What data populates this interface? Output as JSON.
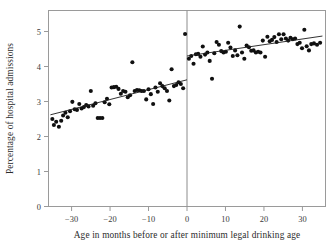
{
  "figure": {
    "name": "minimum-legal-drinking-age-rd-plot",
    "background_color": "#ffffff",
    "frame_color": "#9a9a9a",
    "point_color": "#101010",
    "fit_line_color": "#1c1c1c",
    "cutoff_line_color": "#8c8c8c"
  },
  "chart_data": {
    "type": "scatter",
    "title": "",
    "subtitle": "",
    "xlabel": "Age in months before or after minimum legal drinking age",
    "ylabel": "Percentage of hospital admissions",
    "xlim": [
      -36,
      36
    ],
    "ylim": [
      0,
      5.6
    ],
    "xticks": [
      -30,
      -20,
      -10,
      0,
      10,
      20,
      30
    ],
    "xticklabels": [
      "−30",
      "−20",
      "−10",
      "0",
      "10",
      "20",
      "30"
    ],
    "yticks": [
      0,
      1,
      2,
      3,
      4,
      5
    ],
    "yticklabels": [
      "0",
      "1",
      "2",
      "3",
      "4",
      "5"
    ],
    "grid": false,
    "legend": false,
    "cutoff": 0,
    "annotations": [
      {
        "name": "discontinuity-line",
        "x": 0,
        "description": "vertical line at minimum legal drinking age"
      }
    ],
    "series": [
      {
        "name": "below-mlda",
        "label": "Under legal drinking age",
        "marker": "filled-circle",
        "points": [
          [
            -35.0,
            2.5
          ],
          [
            -34.6,
            2.33
          ],
          [
            -34.0,
            2.42
          ],
          [
            -33.3,
            2.28
          ],
          [
            -32.7,
            2.45
          ],
          [
            -32.2,
            2.6
          ],
          [
            -31.6,
            2.68
          ],
          [
            -31.0,
            2.55
          ],
          [
            -30.4,
            2.72
          ],
          [
            -29.8,
            2.99
          ],
          [
            -29.2,
            2.78
          ],
          [
            -28.6,
            2.76
          ],
          [
            -28.0,
            2.93
          ],
          [
            -27.4,
            2.8
          ],
          [
            -26.8,
            2.84
          ],
          [
            -26.2,
            2.9
          ],
          [
            -25.6,
            2.86
          ],
          [
            -25.0,
            3.3
          ],
          [
            -24.4,
            2.88
          ],
          [
            -23.8,
            2.95
          ],
          [
            -23.2,
            2.53
          ],
          [
            -22.6,
            2.53
          ],
          [
            -22.0,
            2.53
          ],
          [
            -21.4,
            2.98
          ],
          [
            -20.8,
            3.08
          ],
          [
            -20.2,
            2.92
          ],
          [
            -19.6,
            3.4
          ],
          [
            -19.0,
            3.41
          ],
          [
            -18.4,
            3.42
          ],
          [
            -17.8,
            3.36
          ],
          [
            -17.2,
            3.22
          ],
          [
            -16.6,
            3.3
          ],
          [
            -16.0,
            3.28
          ],
          [
            -15.4,
            3.12
          ],
          [
            -14.8,
            3.18
          ],
          [
            -14.2,
            4.12
          ],
          [
            -13.6,
            3.3
          ],
          [
            -13.0,
            3.33
          ],
          [
            -12.4,
            3.32
          ],
          [
            -11.8,
            3.3
          ],
          [
            -11.2,
            3.3
          ],
          [
            -10.6,
            3.06
          ],
          [
            -10.0,
            3.35
          ],
          [
            -9.4,
            3.21
          ],
          [
            -8.8,
            2.93
          ],
          [
            -8.2,
            3.4
          ],
          [
            -7.6,
            3.28
          ],
          [
            -7.0,
            3.52
          ],
          [
            -6.4,
            3.44
          ],
          [
            -5.8,
            3.38
          ],
          [
            -5.2,
            3.3
          ],
          [
            -4.6,
            3.03
          ],
          [
            -4.0,
            3.92
          ],
          [
            -3.4,
            3.44
          ],
          [
            -2.8,
            3.47
          ],
          [
            -2.2,
            3.55
          ],
          [
            -1.6,
            3.5
          ],
          [
            -1.0,
            3.38
          ],
          [
            -0.5,
            4.93
          ]
        ]
      },
      {
        "name": "above-mlda",
        "label": "Over legal drinking age",
        "marker": "filled-circle",
        "points": [
          [
            0.5,
            4.22
          ],
          [
            1.1,
            4.3
          ],
          [
            1.7,
            4.08
          ],
          [
            2.3,
            4.35
          ],
          [
            2.9,
            4.36
          ],
          [
            3.5,
            4.28
          ],
          [
            4.1,
            4.57
          ],
          [
            4.7,
            4.34
          ],
          [
            5.3,
            4.4
          ],
          [
            5.9,
            4.16
          ],
          [
            6.5,
            3.65
          ],
          [
            7.1,
            4.38
          ],
          [
            7.7,
            4.7
          ],
          [
            8.3,
            4.62
          ],
          [
            8.9,
            4.44
          ],
          [
            9.5,
            4.4
          ],
          [
            10.1,
            4.42
          ],
          [
            10.7,
            4.68
          ],
          [
            11.3,
            4.54
          ],
          [
            11.9,
            4.3
          ],
          [
            12.5,
            4.46
          ],
          [
            13.1,
            4.32
          ],
          [
            13.7,
            5.14
          ],
          [
            14.3,
            4.4
          ],
          [
            14.9,
            4.22
          ],
          [
            15.5,
            4.6
          ],
          [
            16.1,
            4.55
          ],
          [
            16.7,
            4.45
          ],
          [
            17.3,
            4.46
          ],
          [
            17.9,
            4.4
          ],
          [
            18.5,
            4.42
          ],
          [
            19.1,
            4.4
          ],
          [
            19.7,
            4.74
          ],
          [
            20.3,
            4.28
          ],
          [
            20.9,
            4.85
          ],
          [
            21.5,
            4.72
          ],
          [
            22.1,
            4.76
          ],
          [
            22.7,
            4.84
          ],
          [
            23.3,
            4.7
          ],
          [
            23.9,
            4.92
          ],
          [
            24.5,
            4.78
          ],
          [
            25.1,
            4.92
          ],
          [
            25.7,
            4.8
          ],
          [
            26.3,
            4.74
          ],
          [
            26.9,
            4.82
          ],
          [
            27.5,
            4.78
          ],
          [
            28.1,
            4.8
          ],
          [
            28.7,
            4.64
          ],
          [
            29.3,
            4.68
          ],
          [
            29.9,
            4.52
          ],
          [
            30.5,
            5.05
          ],
          [
            31.1,
            4.58
          ],
          [
            31.7,
            4.46
          ],
          [
            32.3,
            4.64
          ],
          [
            33.0,
            4.66
          ],
          [
            33.8,
            4.62
          ],
          [
            34.6,
            4.68
          ]
        ]
      }
    ],
    "fit_lines": [
      {
        "name": "fit-below-mlda",
        "x": [
          -35.5,
          0
        ],
        "y": [
          2.62,
          3.62
        ]
      },
      {
        "name": "fit-above-mlda",
        "x": [
          0,
          35.2
        ],
        "y": [
          4.3,
          4.87
        ]
      }
    ]
  }
}
